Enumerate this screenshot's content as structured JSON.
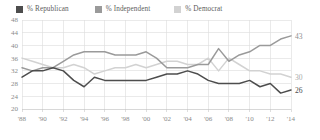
{
  "legend": {
    "items": [
      {
        "label": "% Republican",
        "color": "#4d4d4d",
        "key": "republican"
      },
      {
        "label": "% Independent",
        "color": "#9a9a9a",
        "key": "independent"
      },
      {
        "label": "% Democrat",
        "color": "#d2d2d2",
        "key": "democrat"
      }
    ]
  },
  "end_labels": {
    "independent": "43",
    "democrat": "30",
    "republican": "26"
  },
  "chart_data": {
    "type": "line",
    "title": "",
    "xlabel": "",
    "ylabel": "",
    "ylim": [
      20,
      48
    ],
    "ytick_step": 4,
    "yticks": [
      "48",
      "44",
      "40",
      "36",
      "32",
      "28",
      "24",
      "20"
    ],
    "grid": true,
    "legend_position": "top-left",
    "x": [
      1988,
      1989,
      1990,
      1991,
      1992,
      1993,
      1994,
      1995,
      1996,
      1997,
      1998,
      1999,
      2000,
      2001,
      2002,
      2003,
      2004,
      2005,
      2006,
      2007,
      2008,
      2009,
      2010,
      2011,
      2012,
      2013,
      2014
    ],
    "xticks": [
      "'88",
      "'90",
      "'92",
      "'94",
      "'96",
      "'98",
      "'00",
      "'02",
      "'04",
      "'06",
      "'08",
      "'10",
      "'12",
      "'14"
    ],
    "xtick_years": [
      1988,
      1990,
      1992,
      1994,
      1996,
      1998,
      2000,
      2002,
      2004,
      2006,
      2008,
      2010,
      2012,
      2014
    ],
    "series": [
      {
        "name": "% Republican",
        "color": "#4d4d4d",
        "values": [
          30,
          32,
          32,
          33,
          32,
          29,
          27,
          30,
          29,
          29,
          29,
          29,
          29,
          30,
          31,
          31,
          32,
          31,
          29,
          28,
          28,
          28,
          29,
          27,
          28,
          25,
          26
        ]
      },
      {
        "name": "% Independent",
        "color": "#9a9a9a",
        "values": [
          33,
          32,
          33,
          33,
          35,
          37,
          38,
          38,
          38,
          37,
          37,
          37,
          38,
          36,
          33,
          33,
          33,
          34,
          34,
          39,
          35,
          37,
          38,
          40,
          40,
          42,
          43
        ]
      },
      {
        "name": "% Democrat",
        "color": "#d2d2d2",
        "values": [
          36,
          35,
          34,
          33,
          33,
          34,
          33,
          31,
          32,
          33,
          33,
          34,
          33,
          34,
          35,
          35,
          34,
          34,
          36,
          32,
          36,
          34,
          32,
          32,
          31,
          31,
          30
        ]
      }
    ]
  }
}
